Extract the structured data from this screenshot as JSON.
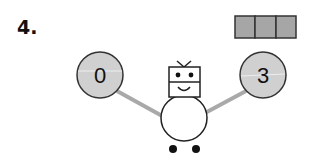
{
  "problem": {
    "number": "4."
  },
  "answer_boxes": {
    "count": 3,
    "fill": "#a6a6a6",
    "stroke": "#333333"
  },
  "number_bond": {
    "left": {
      "value": "0"
    },
    "right": {
      "value": "3"
    },
    "circle_fill": "#d0d0d0",
    "circle_stroke": "#333333",
    "line_color": "#a9a9a9"
  },
  "robot": {
    "label": "robot-character"
  }
}
